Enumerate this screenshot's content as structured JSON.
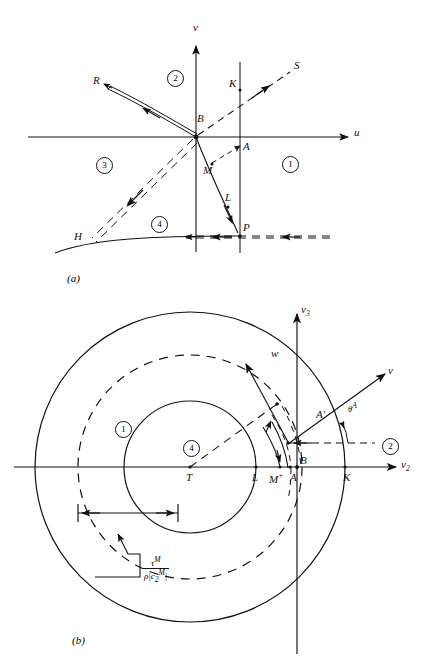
{
  "figure": {
    "panels": [
      {
        "id": "a",
        "label": "(a)"
      },
      {
        "id": "b",
        "label": "(b)"
      }
    ]
  },
  "panel_a": {
    "label": "(a)",
    "axes": {
      "x_label": "u",
      "y_label": "v"
    },
    "regions": [
      {
        "name": "region-1",
        "label": "1"
      },
      {
        "name": "region-2",
        "label": "2"
      },
      {
        "name": "region-3",
        "label": "3"
      },
      {
        "name": "region-4",
        "label": "4"
      }
    ],
    "points": [
      {
        "name": "point-R",
        "label": "R"
      },
      {
        "name": "point-S",
        "label": "S"
      },
      {
        "name": "point-K",
        "label": "K"
      },
      {
        "name": "point-B",
        "label": "B"
      },
      {
        "name": "point-A",
        "label": "A"
      },
      {
        "name": "point-M",
        "label": "M"
      },
      {
        "name": "point-L",
        "label": "L"
      },
      {
        "name": "point-P",
        "label": "P"
      },
      {
        "name": "point-H",
        "label": "H"
      }
    ]
  },
  "panel_b": {
    "label": "(b)",
    "axes": {
      "x_label": "v",
      "x_sub": "2",
      "y_label": "v",
      "y_sub": "3"
    },
    "vectors": [
      {
        "name": "vector-w",
        "label": "w"
      },
      {
        "name": "vector-v",
        "label": "v"
      }
    ],
    "angle": {
      "name": "angle-theta-A",
      "base": "θ",
      "sup": "A"
    },
    "regions": [
      {
        "name": "region-1",
        "label": "1"
      },
      {
        "name": "region-2",
        "label": "2"
      },
      {
        "name": "region-4",
        "label": "4"
      }
    ],
    "points": [
      {
        "name": "point-T",
        "label": "T"
      },
      {
        "name": "point-L",
        "label": "L"
      },
      {
        "name": "point-M-plus",
        "base": "M",
        "sup": "+"
      },
      {
        "name": "point-A",
        "label": "A"
      },
      {
        "name": "point-B",
        "label": "B"
      },
      {
        "name": "point-K",
        "label": "K"
      },
      {
        "name": "point-M-minus",
        "base": "M",
        "sup": "−"
      },
      {
        "name": "point-A-prime",
        "label": "A′"
      },
      {
        "name": "point-B-prime",
        "label": "B′"
      }
    ],
    "measure": {
      "name": "radius-measure",
      "numerator": "τ",
      "numerator_sup": "M",
      "denominator_rho": "ρ",
      "denominator_c": "c",
      "denominator_c_sub": "2",
      "denominator_c_sup": "M"
    }
  },
  "colors": {
    "ink": "#111111",
    "paper": "#ffffff"
  }
}
